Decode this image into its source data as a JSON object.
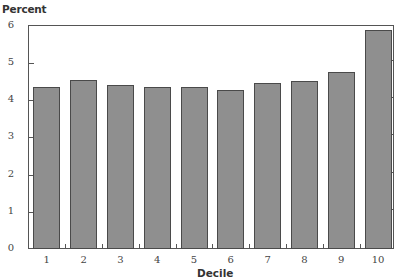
{
  "chart_data": {
    "type": "bar",
    "title": "",
    "ylabel": "Percent",
    "xlabel": "Decile",
    "categories": [
      "1",
      "2",
      "3",
      "4",
      "5",
      "6",
      "7",
      "8",
      "9",
      "10"
    ],
    "values": [
      4.35,
      4.54,
      4.39,
      4.35,
      4.35,
      4.27,
      4.46,
      4.5,
      4.76,
      5.87
    ],
    "ylim": [
      0,
      6
    ],
    "yticks": [
      "0",
      "1",
      "2",
      "3",
      "4",
      "5",
      "6"
    ],
    "grid": false,
    "legend": null,
    "bar_color": "#8f8f8f",
    "bar_edge_color": "#4a4a4a"
  },
  "labels": {
    "y_axis": "Percent",
    "x_axis": "Decile"
  }
}
